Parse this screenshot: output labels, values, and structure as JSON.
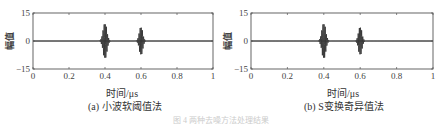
{
  "figure": {
    "caption": "图 4   两种去噪方法处理结果"
  },
  "chart_data": [
    {
      "type": "line",
      "id": "a",
      "caption": "(a) 小波软阈值法",
      "title": "",
      "xlabel": "时间/μs",
      "ylabel": "幅值",
      "xlim": [
        0,
        1
      ],
      "ylim": [
        -15,
        15
      ],
      "xticks": [
        "0",
        "0.2",
        "0.4",
        "0.6",
        "0.8",
        "1"
      ],
      "yticks": [
        "15",
        "0",
        "-15"
      ],
      "grid": false,
      "series": [
        {
          "name": "denoised signal",
          "description": "flat baseline at 0 with two oscillating wave packets",
          "packets": [
            {
              "center": 0.4,
              "peak_amplitude": 10,
              "half_width": 0.02
            },
            {
              "center": 0.6,
              "peak_amplitude": 8,
              "half_width": 0.018
            }
          ]
        }
      ]
    },
    {
      "type": "line",
      "id": "b",
      "caption": "(b) S变换奇异值法",
      "title": "",
      "xlabel": "时间/μs",
      "ylabel": "幅值",
      "xlim": [
        0,
        1
      ],
      "ylim": [
        -15,
        15
      ],
      "xticks": [
        "0",
        "0.2",
        "0.4",
        "0.6",
        "0.8",
        "1"
      ],
      "yticks": [
        "15",
        "0",
        "-15"
      ],
      "grid": false,
      "series": [
        {
          "name": "denoised signal",
          "description": "flat baseline at 0 with two oscillating wave packets",
          "packets": [
            {
              "center": 0.4,
              "peak_amplitude": 10,
              "half_width": 0.02
            },
            {
              "center": 0.6,
              "peak_amplitude": 8,
              "half_width": 0.018
            }
          ]
        }
      ]
    }
  ],
  "colors": {
    "axis": "#555555",
    "trace": "#333333"
  }
}
